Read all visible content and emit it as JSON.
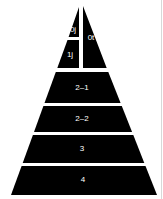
{
  "diagram": {
    "type": "pyramid",
    "fill_color": "#000000",
    "label_color": "#ffffff",
    "tiers": [
      {
        "id": "0j",
        "label": "0j"
      },
      {
        "id": "0t",
        "label": "0t"
      },
      {
        "id": "1j",
        "label": "1j"
      },
      {
        "id": "2-1",
        "label": "2–1"
      },
      {
        "id": "2-2",
        "label": "2–2"
      },
      {
        "id": "3",
        "label": "3"
      },
      {
        "id": "4",
        "label": "4"
      }
    ]
  }
}
